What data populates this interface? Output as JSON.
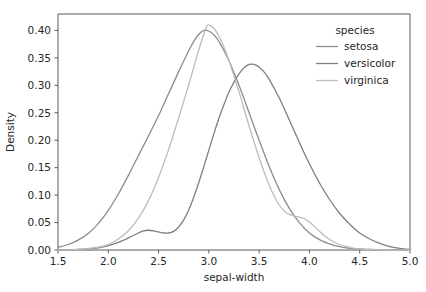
{
  "chart_data": {
    "type": "line",
    "title": "",
    "xlabel": "sepal-width",
    "ylabel": "Density",
    "xlim": [
      1.5,
      5.0
    ],
    "ylim": [
      0.0,
      0.43
    ],
    "grid": false,
    "legend_position": "upper right",
    "legend_title": "species",
    "xticks": [
      1.5,
      2.0,
      2.5,
      3.0,
      3.5,
      4.0,
      4.5,
      5.0
    ],
    "xtick_labels": [
      "1.5",
      "2.0",
      "2.5",
      "3.0",
      "3.5",
      "4.0",
      "4.5",
      "5.0"
    ],
    "yticks": [
      0.0,
      0.05,
      0.1,
      0.15,
      0.2,
      0.25,
      0.3,
      0.35,
      0.4
    ],
    "ytick_labels": [
      "0.00",
      "0.05",
      "0.10",
      "0.15",
      "0.20",
      "0.25",
      "0.30",
      "0.35",
      "0.40"
    ],
    "series": [
      {
        "name": "setosa",
        "color": "#8c8c8c",
        "peak_x": 2.95,
        "peak_y": 0.4,
        "points": [
          [
            1.5,
            0.005
          ],
          [
            1.6,
            0.01
          ],
          [
            1.7,
            0.018
          ],
          [
            1.8,
            0.03
          ],
          [
            1.9,
            0.048
          ],
          [
            2.0,
            0.072
          ],
          [
            2.1,
            0.102
          ],
          [
            2.2,
            0.136
          ],
          [
            2.3,
            0.172
          ],
          [
            2.4,
            0.208
          ],
          [
            2.5,
            0.245
          ],
          [
            2.6,
            0.285
          ],
          [
            2.7,
            0.325
          ],
          [
            2.8,
            0.363
          ],
          [
            2.85,
            0.38
          ],
          [
            2.9,
            0.393
          ],
          [
            2.95,
            0.4
          ],
          [
            3.0,
            0.399
          ],
          [
            3.05,
            0.392
          ],
          [
            3.1,
            0.38
          ],
          [
            3.2,
            0.345
          ],
          [
            3.3,
            0.3
          ],
          [
            3.4,
            0.25
          ],
          [
            3.5,
            0.2
          ],
          [
            3.6,
            0.152
          ],
          [
            3.7,
            0.11
          ],
          [
            3.8,
            0.076
          ],
          [
            3.9,
            0.05
          ],
          [
            4.0,
            0.031
          ],
          [
            4.1,
            0.019
          ],
          [
            4.2,
            0.011
          ],
          [
            4.3,
            0.006
          ],
          [
            4.4,
            0.003
          ],
          [
            4.5,
            0.002
          ],
          [
            4.6,
            0.001
          ],
          [
            4.8,
            0.0
          ],
          [
            5.0,
            0.0
          ]
        ]
      },
      {
        "name": "versicolor",
        "color": "#7f7f7f",
        "peak_x": 3.4,
        "peak_y": 0.34,
        "points": [
          [
            1.5,
            0.0
          ],
          [
            1.7,
            0.001
          ],
          [
            1.9,
            0.004
          ],
          [
            2.0,
            0.008
          ],
          [
            2.1,
            0.014
          ],
          [
            2.2,
            0.022
          ],
          [
            2.3,
            0.031
          ],
          [
            2.35,
            0.035
          ],
          [
            2.4,
            0.036
          ],
          [
            2.45,
            0.035
          ],
          [
            2.5,
            0.033
          ],
          [
            2.55,
            0.031
          ],
          [
            2.6,
            0.031
          ],
          [
            2.65,
            0.034
          ],
          [
            2.7,
            0.042
          ],
          [
            2.75,
            0.055
          ],
          [
            2.8,
            0.073
          ],
          [
            2.85,
            0.096
          ],
          [
            2.9,
            0.123
          ],
          [
            2.95,
            0.152
          ],
          [
            3.0,
            0.182
          ],
          [
            3.05,
            0.212
          ],
          [
            3.1,
            0.24
          ],
          [
            3.15,
            0.265
          ],
          [
            3.2,
            0.288
          ],
          [
            3.25,
            0.306
          ],
          [
            3.3,
            0.321
          ],
          [
            3.35,
            0.332
          ],
          [
            3.4,
            0.338
          ],
          [
            3.45,
            0.338
          ],
          [
            3.5,
            0.333
          ],
          [
            3.55,
            0.324
          ],
          [
            3.6,
            0.311
          ],
          [
            3.7,
            0.277
          ],
          [
            3.8,
            0.237
          ],
          [
            3.9,
            0.196
          ],
          [
            4.0,
            0.157
          ],
          [
            4.1,
            0.122
          ],
          [
            4.2,
            0.092
          ],
          [
            4.3,
            0.067
          ],
          [
            4.4,
            0.047
          ],
          [
            4.5,
            0.031
          ],
          [
            4.6,
            0.02
          ],
          [
            4.7,
            0.012
          ],
          [
            4.8,
            0.006
          ],
          [
            4.9,
            0.003
          ],
          [
            5.0,
            0.001
          ]
        ]
      },
      {
        "name": "virginica",
        "color": "#bcbcbc",
        "peak_x": 2.98,
        "peak_y": 0.41,
        "points": [
          [
            1.5,
            0.0
          ],
          [
            1.7,
            0.001
          ],
          [
            1.9,
            0.005
          ],
          [
            2.0,
            0.01
          ],
          [
            2.1,
            0.02
          ],
          [
            2.2,
            0.035
          ],
          [
            2.3,
            0.058
          ],
          [
            2.4,
            0.09
          ],
          [
            2.5,
            0.132
          ],
          [
            2.6,
            0.183
          ],
          [
            2.7,
            0.241
          ],
          [
            2.75,
            0.271
          ],
          [
            2.8,
            0.301
          ],
          [
            2.85,
            0.333
          ],
          [
            2.9,
            0.365
          ],
          [
            2.95,
            0.393
          ],
          [
            2.98,
            0.408
          ],
          [
            3.0,
            0.41
          ],
          [
            3.05,
            0.404
          ],
          [
            3.1,
            0.39
          ],
          [
            3.15,
            0.37
          ],
          [
            3.2,
            0.345
          ],
          [
            3.3,
            0.288
          ],
          [
            3.4,
            0.226
          ],
          [
            3.5,
            0.168
          ],
          [
            3.55,
            0.142
          ],
          [
            3.6,
            0.118
          ],
          [
            3.65,
            0.098
          ],
          [
            3.7,
            0.082
          ],
          [
            3.75,
            0.071
          ],
          [
            3.8,
            0.065
          ],
          [
            3.85,
            0.062
          ],
          [
            3.9,
            0.06
          ],
          [
            3.95,
            0.057
          ],
          [
            4.0,
            0.051
          ],
          [
            4.05,
            0.043
          ],
          [
            4.1,
            0.034
          ],
          [
            4.2,
            0.019
          ],
          [
            4.3,
            0.01
          ],
          [
            4.4,
            0.005
          ],
          [
            4.5,
            0.002
          ],
          [
            4.6,
            0.001
          ],
          [
            4.8,
            0.0
          ],
          [
            5.0,
            0.0
          ]
        ]
      }
    ]
  },
  "axes": {
    "xlabel": "sepal-width",
    "ylabel": "Density"
  },
  "legend": {
    "title": "species",
    "items": [
      {
        "label": "setosa",
        "color": "#8c8c8c"
      },
      {
        "label": "versicolor",
        "color": "#7f7f7f"
      },
      {
        "label": "virginica",
        "color": "#bcbcbc"
      }
    ]
  }
}
